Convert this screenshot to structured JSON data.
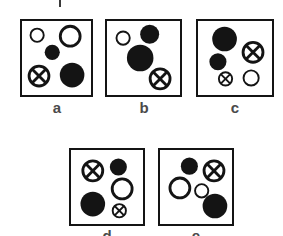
{
  "figure": {
    "caption_fragment_top": "|",
    "background_color": "#ffffff",
    "stroke_color": "#141414",
    "fill_color": "#141414",
    "label_color": "#4a4a4a"
  },
  "panels": [
    {
      "id": "a",
      "label": "a",
      "box": {
        "x": 20,
        "y": 19,
        "w": 73,
        "h": 78
      },
      "shapes": [
        {
          "kind": "open-circle",
          "cx": 16,
          "cy": 15,
          "r": 8
        },
        {
          "kind": "open-circle",
          "cx": 51,
          "cy": 16,
          "r": 12
        },
        {
          "kind": "filled-circle",
          "cx": 32,
          "cy": 33,
          "r": 8
        },
        {
          "kind": "crossed-circle",
          "cx": 18,
          "cy": 58,
          "r": 12
        },
        {
          "kind": "filled-circle",
          "cx": 53,
          "cy": 57,
          "r": 13
        }
      ]
    },
    {
      "id": "b",
      "label": "b",
      "box": {
        "x": 105,
        "y": 19,
        "w": 77,
        "h": 78
      },
      "shapes": [
        {
          "kind": "open-circle",
          "cx": 17,
          "cy": 18,
          "r": 8
        },
        {
          "kind": "filled-circle",
          "cx": 45,
          "cy": 14,
          "r": 10
        },
        {
          "kind": "filled-circle",
          "cx": 35,
          "cy": 39,
          "r": 14
        },
        {
          "kind": "crossed-circle",
          "cx": 56,
          "cy": 61,
          "r": 12
        }
      ]
    },
    {
      "id": "c",
      "label": "c",
      "box": {
        "x": 196,
        "y": 19,
        "w": 78,
        "h": 78
      },
      "shapes": [
        {
          "kind": "filled-circle",
          "cx": 28,
          "cy": 19,
          "r": 13
        },
        {
          "kind": "crossed-circle",
          "cx": 58,
          "cy": 33,
          "r": 12
        },
        {
          "kind": "filled-circle",
          "cx": 21,
          "cy": 43,
          "r": 9
        },
        {
          "kind": "crossed-circle",
          "cx": 29,
          "cy": 61,
          "r": 8
        },
        {
          "kind": "open-circle",
          "cx": 56,
          "cy": 60,
          "r": 9
        }
      ]
    },
    {
      "id": "d",
      "label": "d",
      "box": {
        "x": 69,
        "y": 148,
        "w": 76,
        "h": 78
      },
      "shapes": [
        {
          "kind": "crossed-circle",
          "cx": 23,
          "cy": 22,
          "r": 12
        },
        {
          "kind": "filled-circle",
          "cx": 50,
          "cy": 18,
          "r": 9
        },
        {
          "kind": "open-circle",
          "cx": 54,
          "cy": 41,
          "r": 12
        },
        {
          "kind": "filled-circle",
          "cx": 23,
          "cy": 57,
          "r": 13
        },
        {
          "kind": "crossed-circle",
          "cx": 51,
          "cy": 64,
          "r": 8
        }
      ]
    },
    {
      "id": "e",
      "label": "e",
      "box": {
        "x": 158,
        "y": 148,
        "w": 76,
        "h": 78
      },
      "shapes": [
        {
          "kind": "filled-circle",
          "cx": 31,
          "cy": 17,
          "r": 9
        },
        {
          "kind": "crossed-circle",
          "cx": 57,
          "cy": 22,
          "r": 12
        },
        {
          "kind": "open-circle",
          "cx": 21,
          "cy": 40,
          "r": 12
        },
        {
          "kind": "open-circle",
          "cx": 44,
          "cy": 43,
          "r": 8
        },
        {
          "kind": "filled-circle",
          "cx": 58,
          "cy": 59,
          "r": 13
        }
      ]
    }
  ]
}
